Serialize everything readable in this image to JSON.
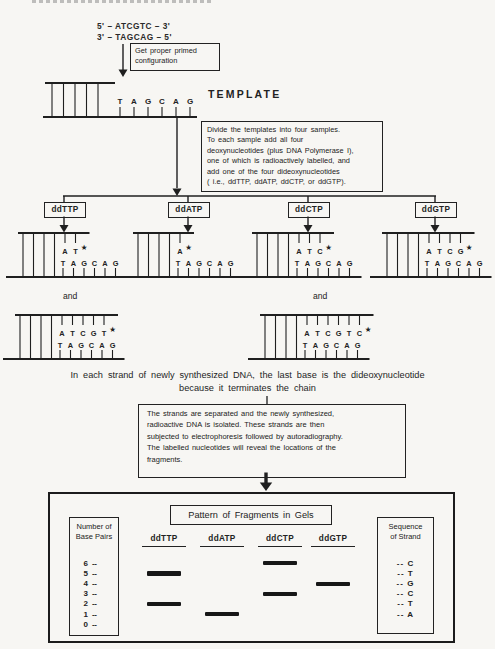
{
  "top": {
    "strand_a": "5' – ATCGTC – 3'",
    "strand_b": "3' – TAGCAG – 5'",
    "primed_box_text": "Get proper primed\nconfiguration",
    "template_label": "TEMPLATE"
  },
  "divide_box_text": "Divide the templates into four samples.\nTo each sample add all four\ndeoxynucleotides (plus DNA Polymerase I),\none of which is radioactively labelled, and\nadd one of the four dideoxynucleotides\n( i.e., ddTTP, ddATP, ddCTP, or ddGTP).",
  "template_strand": "TAGCAG",
  "star_glyph": "★",
  "branches": [
    {
      "label": "ddTTP",
      "new_bases": "AT"
    },
    {
      "label": "ddATP",
      "new_bases": "A"
    },
    {
      "label": "ddCTP",
      "new_bases": "ATC"
    },
    {
      "label": "ddGTP",
      "new_bases": "ATCG"
    }
  ],
  "and_label": "and",
  "and_strands": [
    {
      "new_bases": "ATCGT"
    },
    {
      "new_bases": "ATCGTC"
    }
  ],
  "caption": {
    "line1": "In each strand of newly synthesized DNA, the last base is the dideoxynucleotide",
    "line2": "because it terminates the chain"
  },
  "separation_box_text": "The strands are separated and the newly synthesized,\nradioactive DNA is isolated.  These strands are then\nsubjected to electrophoresis followed by autoradiography.\nThe labelled nucleotides will reveal the locations of the\nfragments.",
  "gel": {
    "title": "Pattern of Fragments in Gels",
    "left_box_title": "Number of\nBase Pairs",
    "base_pair_labels": [
      "6",
      "5",
      "4",
      "3",
      "2",
      "1",
      "0"
    ],
    "tick": "--",
    "lanes": [
      {
        "label": "ddTTP",
        "bands": [
          5,
          2
        ]
      },
      {
        "label": "ddATP",
        "bands": [
          1
        ]
      },
      {
        "label": "ddCTP",
        "bands": [
          6,
          3
        ]
      },
      {
        "label": "ddGTP",
        "bands": [
          4
        ]
      }
    ],
    "right_box_title": "Sequence\nof Strand",
    "sequence_rows": [
      "-- C",
      "-- T",
      "-- G",
      "-- C",
      "-- T",
      "-- A"
    ]
  }
}
